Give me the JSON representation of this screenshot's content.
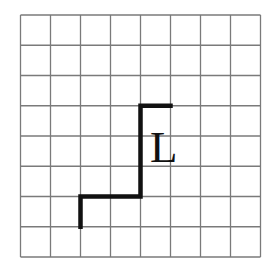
{
  "grid": {
    "columns": 8,
    "rows": 8,
    "origin_x": 20.5,
    "origin_y": 15,
    "cell_width": 30,
    "cell_height": 30.25,
    "line_color": "#7a7a7a",
    "line_width": 1.3
  },
  "path": {
    "points": [
      [
        2,
        7
      ],
      [
        2,
        6
      ],
      [
        4,
        6
      ],
      [
        4,
        3
      ],
      [
        5,
        3
      ]
    ],
    "color": "#111111",
    "width": 4.5
  },
  "label": {
    "text": "L",
    "x": 150,
    "y": 125
  }
}
